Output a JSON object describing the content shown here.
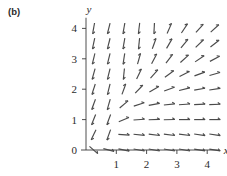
{
  "figure": {
    "panel_label": "(b)",
    "type": "direction-field",
    "axis_x_name": "x",
    "axis_y_name": "y"
  },
  "chart_data": {
    "type": "scatter",
    "plot_kind": "direction-field",
    "title": "",
    "subtitle": "",
    "xlabel": "x",
    "ylabel": "y",
    "xlim": [
      0,
      4.35
    ],
    "ylim": [
      0,
      4.35
    ],
    "xticks": [
      1,
      2,
      3,
      4
    ],
    "ytricks_note": "y ticks shown at 0,1,2,3,4",
    "yticks": [
      0,
      1,
      2,
      3,
      4
    ],
    "xtick_labels": [
      "1",
      "2",
      "3",
      "4"
    ],
    "ytick_labels": [
      "0",
      "1",
      "2",
      "3",
      "4"
    ],
    "grid": false,
    "legend": "none",
    "annotations": [
      "(b)"
    ],
    "arrow_grid": {
      "x_start": 0.25,
      "x_end": 4.25,
      "x_step": 0.5,
      "y_start": 0.0,
      "y_end": 4.0,
      "y_step": 0.5,
      "arrow_length_px": 11,
      "description": "Unit-length slope segments drawn on a 0.5 by 0.5 lattice. Slope direction field of a system whose trajectories leave the y-axis region steeply downward, turn through a transition near (0.5, 0.5), and flow rightward becoming nearly horizontal at large x and diagonally up-right at large x and large y."
    },
    "vectors": [
      {
        "x": 0.25,
        "y": 4.0,
        "angle_deg": 260
      },
      {
        "x": 0.75,
        "y": 4.0,
        "angle_deg": 256
      },
      {
        "x": 1.25,
        "y": 4.0,
        "angle_deg": 260
      },
      {
        "x": 1.75,
        "y": 4.0,
        "angle_deg": 263
      },
      {
        "x": 2.25,
        "y": 4.0,
        "angle_deg": 267
      },
      {
        "x": 2.75,
        "y": 4.0,
        "angle_deg": 66
      },
      {
        "x": 3.25,
        "y": 4.0,
        "angle_deg": 56
      },
      {
        "x": 3.75,
        "y": 4.0,
        "angle_deg": 48
      },
      {
        "x": 4.25,
        "y": 4.0,
        "angle_deg": 42
      },
      {
        "x": 0.25,
        "y": 3.5,
        "angle_deg": 258
      },
      {
        "x": 0.75,
        "y": 3.5,
        "angle_deg": 256
      },
      {
        "x": 1.25,
        "y": 3.5,
        "angle_deg": 260
      },
      {
        "x": 1.75,
        "y": 3.5,
        "angle_deg": 264
      },
      {
        "x": 2.25,
        "y": 3.5,
        "angle_deg": 70
      },
      {
        "x": 2.75,
        "y": 3.5,
        "angle_deg": 60
      },
      {
        "x": 3.25,
        "y": 3.5,
        "angle_deg": 50
      },
      {
        "x": 3.75,
        "y": 3.5,
        "angle_deg": 44
      },
      {
        "x": 4.25,
        "y": 3.5,
        "angle_deg": 38
      },
      {
        "x": 0.25,
        "y": 3.0,
        "angle_deg": 256
      },
      {
        "x": 0.75,
        "y": 3.0,
        "angle_deg": 256
      },
      {
        "x": 1.25,
        "y": 3.0,
        "angle_deg": 261
      },
      {
        "x": 1.75,
        "y": 3.0,
        "angle_deg": 74
      },
      {
        "x": 2.25,
        "y": 3.0,
        "angle_deg": 62
      },
      {
        "x": 2.75,
        "y": 3.0,
        "angle_deg": 52
      },
      {
        "x": 3.25,
        "y": 3.0,
        "angle_deg": 42
      },
      {
        "x": 3.75,
        "y": 3.0,
        "angle_deg": 34
      },
      {
        "x": 4.25,
        "y": 3.0,
        "angle_deg": 28
      },
      {
        "x": 0.25,
        "y": 2.5,
        "angle_deg": 254
      },
      {
        "x": 0.75,
        "y": 2.5,
        "angle_deg": 256
      },
      {
        "x": 1.25,
        "y": 2.5,
        "angle_deg": 264
      },
      {
        "x": 1.75,
        "y": 2.5,
        "angle_deg": 64
      },
      {
        "x": 2.25,
        "y": 2.5,
        "angle_deg": 48
      },
      {
        "x": 2.75,
        "y": 2.5,
        "angle_deg": 36
      },
      {
        "x": 3.25,
        "y": 2.5,
        "angle_deg": 26
      },
      {
        "x": 3.75,
        "y": 2.5,
        "angle_deg": 20
      },
      {
        "x": 4.25,
        "y": 2.5,
        "angle_deg": 16
      },
      {
        "x": 0.25,
        "y": 2.0,
        "angle_deg": 252
      },
      {
        "x": 0.75,
        "y": 2.0,
        "angle_deg": 256
      },
      {
        "x": 1.25,
        "y": 2.0,
        "angle_deg": 70
      },
      {
        "x": 1.75,
        "y": 2.0,
        "angle_deg": 46
      },
      {
        "x": 2.25,
        "y": 2.0,
        "angle_deg": 30
      },
      {
        "x": 2.75,
        "y": 2.0,
        "angle_deg": 20
      },
      {
        "x": 3.25,
        "y": 2.0,
        "angle_deg": 14
      },
      {
        "x": 3.75,
        "y": 2.0,
        "angle_deg": 10
      },
      {
        "x": 4.25,
        "y": 2.0,
        "angle_deg": 8
      },
      {
        "x": 0.25,
        "y": 1.5,
        "angle_deg": 250
      },
      {
        "x": 0.75,
        "y": 1.5,
        "angle_deg": 254
      },
      {
        "x": 1.25,
        "y": 1.5,
        "angle_deg": 40
      },
      {
        "x": 1.75,
        "y": 1.5,
        "angle_deg": 18
      },
      {
        "x": 2.25,
        "y": 1.5,
        "angle_deg": 10
      },
      {
        "x": 2.75,
        "y": 1.5,
        "angle_deg": 6
      },
      {
        "x": 3.25,
        "y": 1.5,
        "angle_deg": 4
      },
      {
        "x": 3.75,
        "y": 1.5,
        "angle_deg": 3
      },
      {
        "x": 4.25,
        "y": 1.5,
        "angle_deg": 2
      },
      {
        "x": 0.25,
        "y": 1.0,
        "angle_deg": 248
      },
      {
        "x": 0.75,
        "y": 1.0,
        "angle_deg": 250
      },
      {
        "x": 1.25,
        "y": 1.0,
        "angle_deg": 22
      },
      {
        "x": 1.75,
        "y": 1.0,
        "angle_deg": 4
      },
      {
        "x": 2.25,
        "y": 1.0,
        "angle_deg": 2
      },
      {
        "x": 2.75,
        "y": 1.0,
        "angle_deg": 1
      },
      {
        "x": 3.25,
        "y": 1.0,
        "angle_deg": 0
      },
      {
        "x": 3.75,
        "y": 1.0,
        "angle_deg": 0
      },
      {
        "x": 4.25,
        "y": 1.0,
        "angle_deg": 0
      },
      {
        "x": 0.25,
        "y": 0.5,
        "angle_deg": 244
      },
      {
        "x": 0.75,
        "y": 0.5,
        "angle_deg": 250
      },
      {
        "x": 1.25,
        "y": 0.5,
        "angle_deg": 356
      },
      {
        "x": 1.75,
        "y": 0.5,
        "angle_deg": 354
      },
      {
        "x": 2.25,
        "y": 0.5,
        "angle_deg": 353
      },
      {
        "x": 2.75,
        "y": 0.5,
        "angle_deg": 353
      },
      {
        "x": 3.25,
        "y": 0.5,
        "angle_deg": 353
      },
      {
        "x": 3.75,
        "y": 0.5,
        "angle_deg": 352
      },
      {
        "x": 4.25,
        "y": 0.5,
        "angle_deg": 352
      },
      {
        "x": 0.25,
        "y": 0.0,
        "angle_deg": 318
      },
      {
        "x": 0.75,
        "y": 0.0,
        "angle_deg": 346
      },
      {
        "x": 1.25,
        "y": 0.0,
        "angle_deg": 348
      },
      {
        "x": 1.75,
        "y": 0.0,
        "angle_deg": 349
      },
      {
        "x": 2.25,
        "y": 0.0,
        "angle_deg": 350
      },
      {
        "x": 2.75,
        "y": 0.0,
        "angle_deg": 350
      },
      {
        "x": 3.25,
        "y": 0.0,
        "angle_deg": 350
      },
      {
        "x": 3.75,
        "y": 0.0,
        "angle_deg": 351
      },
      {
        "x": 4.25,
        "y": 0.0,
        "angle_deg": 351
      }
    ]
  }
}
